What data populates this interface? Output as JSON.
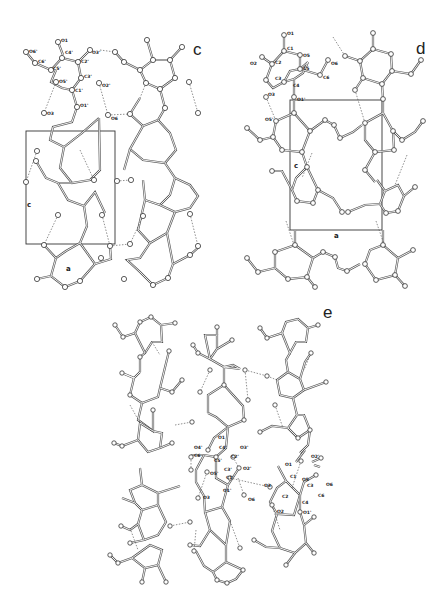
{
  "figure": {
    "panels": [
      {
        "id": "c",
        "letter": "c",
        "cell_axes": {
          "vertical": "c",
          "horizontal": "a"
        },
        "atom_labels": [
          "O1",
          "O6'",
          "C6'",
          "C4'",
          "O3'",
          "C2'",
          "C5'",
          "C3'",
          "O2'",
          "O5'",
          "C1'",
          "O1'",
          "O3",
          "O6"
        ]
      },
      {
        "id": "d",
        "letter": "d",
        "cell_axes": {
          "vertical": "c",
          "horizontal": "a"
        },
        "atom_labels": [
          "O1",
          "C1",
          "O5",
          "O2",
          "C2",
          "C5",
          "O6",
          "C6",
          "C3",
          "C4",
          "O3",
          "O1'",
          "O5'"
        ]
      },
      {
        "id": "e",
        "letter": "e",
        "atom_labels": [
          "O1",
          "O4'",
          "C4'",
          "O3'",
          "C6",
          "C5'",
          "C2'",
          "C3'",
          "O2'",
          "O5'",
          "C1'",
          "O1'",
          "O3",
          "O6",
          "O1",
          "O2'",
          "C1",
          "O5",
          "O3",
          "C3",
          "O6",
          "C6",
          "C2",
          "C4",
          "O2",
          "O1'"
        ]
      }
    ]
  }
}
